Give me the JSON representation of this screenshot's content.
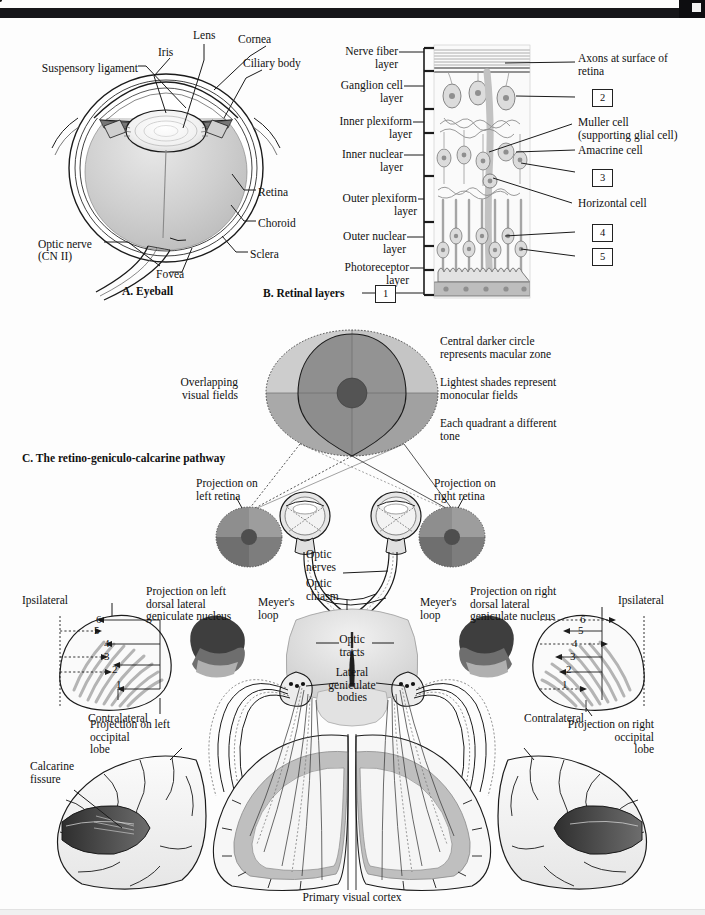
{
  "figure": {
    "panels": [
      {
        "id": "A",
        "title": "A. Eyeball"
      },
      {
        "id": "B",
        "title": "B. Retinal layers"
      },
      {
        "id": "C",
        "title": "C. The retino-geniculo-calcarine pathway"
      }
    ]
  },
  "panel_a": {
    "title": "A. Eyeball",
    "labels": {
      "suspensory_ligament": "Suspensory ligament",
      "iris": "Iris",
      "lens": "Lens",
      "cornea": "Cornea",
      "ciliary_body": "Ciliary body",
      "retina": "Retina",
      "choroid": "Choroid",
      "sclera": "Sclera",
      "fovea": "Fovea",
      "optic_nerve_line1": "Optic nerve",
      "optic_nerve_line2": "(CN II)"
    }
  },
  "panel_b": {
    "title": "B. Retinal layers",
    "layer_labels": [
      "Nerve fiber\nlayer",
      "Ganglion cell\nlayer",
      "Inner plexiform\nlayer",
      "Inner nuclear\nlayer",
      "Outer plexiform\nlayer",
      "Outer nuclear\nlayer",
      "Photoreceptor\nlayer"
    ],
    "right_labels": {
      "axons": "Axons at surface of\nretina",
      "muller": "Muller cell\n(supporting glial cell)",
      "amacrine": "Amacrine cell",
      "horizontal": "Horizontal cell"
    },
    "numbered_boxes": [
      "1",
      "2",
      "3",
      "4",
      "5"
    ]
  },
  "panel_c": {
    "title": "C. The retino-geniculo-calcarine pathway",
    "visual_field": {
      "left_label": "Overlapping\nvisual fields",
      "notes": [
        "Central darker circle\nrepresents macular zone",
        "Lightest shades represent\nmonocular fields",
        "Each quadrant a different\ntone"
      ]
    },
    "labels": {
      "projection_left_retina": "Projection on\nleft retina",
      "projection_right_retina": "Projection on\nright retina",
      "optic_nerves": "Optic\nnerves",
      "optic_chiasm": "Optic\nchiasm",
      "optic_tracts": "Optic\ntracts",
      "lateral_geniculate_bodies": "Lateral\ngeniculate\nbodies",
      "meyers_loop_left": "Meyer's\nloop",
      "meyers_loop_right": "Meyer's\nloop",
      "projection_left_lgn": "Projection on left\ndorsal lateral\ngeniculate nucleus",
      "projection_right_lgn": "Projection on right\ndorsal lateral\ngeniculate nucleus",
      "ipsilateral_left": "Ipsilateral",
      "contralateral_left": "Contralateral",
      "ipsilateral_right": "Ipsilateral",
      "contralateral_right": "Contralateral",
      "projection_left_occipital": "Projection on left\noccipital\nlobe",
      "projection_right_occipital": "Projection on right\noccipital\nlobe",
      "calcarine_fissure": "Calcarine\nfissure",
      "primary_visual_cortex": "Primary visual cortex"
    },
    "lgn_layer_numbers": [
      "6",
      "5",
      "4",
      "3",
      "2",
      "1"
    ]
  },
  "colors": {
    "ink": "#1b1b1b",
    "band": "#17171a",
    "page": "#fdfdfd",
    "tone_lightest": "#c9c9c9",
    "tone_light": "#b3b3b3",
    "tone_mid": "#9b9b9b",
    "tone_dark": "#7d7d7d",
    "tone_darker": "#6a6a6a",
    "macula": "#4a4a4a",
    "tissue_fill": "#d6d6d6",
    "cortex_gray": "#b8b8b8",
    "calcarine_dark": "#4f4f4f"
  }
}
